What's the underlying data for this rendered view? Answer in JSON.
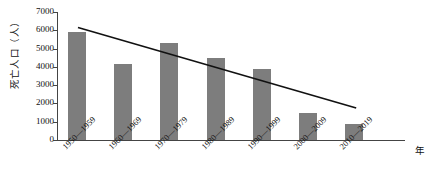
{
  "chart_data": {
    "type": "bar",
    "title": "",
    "subtitle": "",
    "xlabel": "年",
    "ylabel": "死亡人口（人）",
    "categories": [
      "1950—1959",
      "1960—1969",
      "1970—1979",
      "1980—1989",
      "1990—1999",
      "2000—2009",
      "2010—2019"
    ],
    "values": [
      5900,
      4150,
      5300,
      4500,
      3900,
      1500,
      900
    ],
    "ylim": [
      0,
      7000
    ],
    "y_ticks": [
      0,
      1000,
      2000,
      3000,
      4000,
      5000,
      6000,
      7000
    ],
    "y_tick_labels": [
      "0",
      "1000",
      "2000",
      "3000",
      "4000",
      "5000",
      "6000",
      "7000"
    ],
    "grid": false,
    "legend": "none",
    "bar_color": "#7d7d7d",
    "axis_color": "#444444",
    "series": [
      {
        "name": "死亡人口",
        "values": [
          5900,
          4150,
          5300,
          4500,
          3900,
          1500,
          900
        ]
      }
    ],
    "annotations": [
      {
        "name": "trendline",
        "type": "line",
        "description": "linear declining trend line",
        "color": "#111111",
        "x_start": "1950—1959",
        "y_start": 6150,
        "x_end": "2010—2019",
        "y_end": 1750
      }
    ]
  }
}
